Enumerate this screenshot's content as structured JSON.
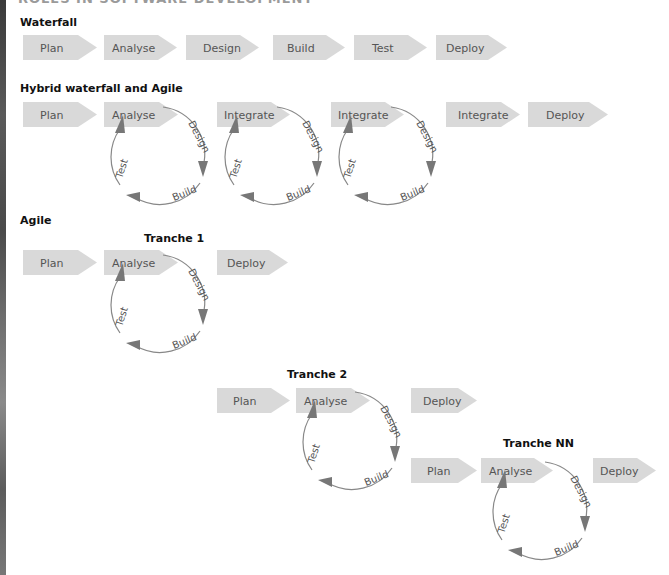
{
  "page_heading_cut": "ROLES IN SOFTWARE DEVELOPMENT",
  "sections": {
    "waterfall": {
      "title": "Waterfall",
      "steps": [
        "Plan",
        "Analyse",
        "Design",
        "Build",
        "Test",
        "Deploy"
      ]
    },
    "hybrid": {
      "title": "Hybrid waterfall and Agile",
      "steps": [
        "Plan",
        "Analyse",
        "Integrate",
        "Integrate",
        "Integrate",
        "Deploy"
      ],
      "cycle_labels": [
        "Design",
        "Build",
        "Test"
      ]
    },
    "agile": {
      "title": "Agile",
      "tranches": [
        {
          "title": "Tranche 1",
          "steps": [
            "Plan",
            "Analyse",
            "Deploy"
          ]
        },
        {
          "title": "Tranche 2",
          "steps": [
            "Plan",
            "Analyse",
            "Deploy"
          ]
        },
        {
          "title": "Tranche NN",
          "steps": [
            "Plan",
            "Analyse",
            "Deploy"
          ]
        }
      ],
      "cycle_labels": [
        "Design",
        "Build",
        "Test"
      ]
    }
  },
  "colors": {
    "chevron_fill": "#d9d9d9",
    "chevron_text": "#555555",
    "arrow": "#777777",
    "title_text": "#111111"
  }
}
